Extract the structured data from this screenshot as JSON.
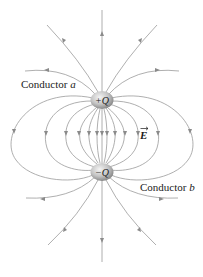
{
  "figure": {
    "conductor_a": {
      "label_prefix": "Conductor ",
      "label_letter": "a",
      "charge_label": "+Q",
      "center": [
        102,
        100
      ]
    },
    "conductor_b": {
      "label_prefix": "Conductor ",
      "label_letter": "b",
      "charge_label": "−Q",
      "center": [
        102,
        172
      ]
    },
    "field_label": "E",
    "colors": {
      "field_line": "#9a9a9a",
      "sphere_light": "#f2f2f2",
      "sphere_dark": "#8c8c8c",
      "text": "#222222"
    }
  }
}
